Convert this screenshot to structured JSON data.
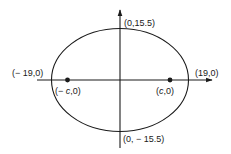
{
  "diagram": {
    "type": "ellipse",
    "colors": {
      "stroke": "#1a1a1a",
      "background": "#ffffff"
    },
    "axes": {
      "x_axis": {
        "arrow": "right"
      },
      "y_axis": {
        "arrow": "up"
      }
    },
    "vertices": {
      "left": {
        "label": "(− 19,0)",
        "x": -19,
        "y": 0
      },
      "right": {
        "label": "(19,0)",
        "x": 19,
        "y": 0
      }
    },
    "co_vertices": {
      "top": {
        "label": "(0,15.5)",
        "x": 0,
        "y": 15.5
      },
      "bottom": {
        "label": "(0, − 15.5)",
        "x": 0,
        "y": -15.5
      }
    },
    "foci": {
      "left": {
        "label_prefix": "(− ",
        "label_var": "c",
        "label_suffix": ",0)"
      },
      "right": {
        "label_prefix": "(",
        "label_var": "c",
        "label_suffix": ",0)"
      }
    },
    "semi_major_axis": 19,
    "semi_minor_axis": 15.5
  }
}
